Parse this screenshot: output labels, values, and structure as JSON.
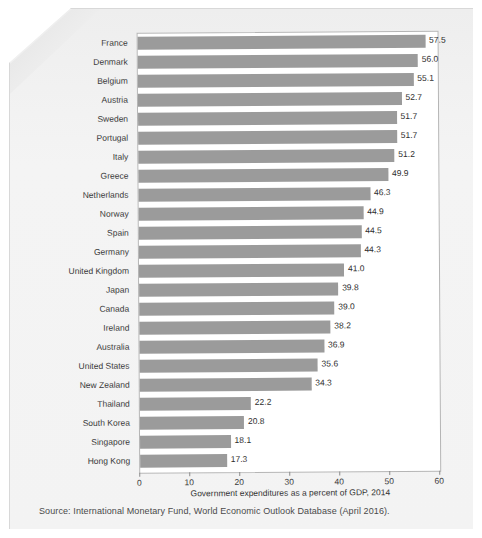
{
  "chart_data": {
    "type": "bar",
    "orientation": "horizontal",
    "title": "",
    "xlabel": "Government expenditures as a percent of GDP, 2014",
    "ylabel": "",
    "xlim": [
      0,
      60
    ],
    "xticks": [
      0,
      10,
      20,
      30,
      40,
      50,
      60
    ],
    "grid": false,
    "legend": false,
    "bar_color": "#9b9b9b",
    "categories": [
      "France",
      "Denmark",
      "Belgium",
      "Austria",
      "Sweden",
      "Portugal",
      "Italy",
      "Greece",
      "Netherlands",
      "Norway",
      "Spain",
      "Germany",
      "United Kingdom",
      "Japan",
      "Canada",
      "Ireland",
      "Australia",
      "United States",
      "New Zealand",
      "Thailand",
      "South Korea",
      "Singapore",
      "Hong Kong"
    ],
    "values": [
      57.5,
      56.0,
      55.1,
      52.7,
      51.7,
      51.7,
      51.2,
      49.9,
      46.3,
      44.9,
      44.5,
      44.3,
      41.0,
      39.8,
      39.0,
      38.2,
      36.9,
      35.6,
      34.3,
      22.2,
      20.8,
      18.1,
      17.3
    ],
    "value_labels": [
      "57.5",
      "56.0",
      "55.1",
      "52.7",
      "51.7",
      "51.7",
      "51.2",
      "49.9",
      "46.3",
      "44.9",
      "44.5",
      "44.3",
      "41.0",
      "39.8",
      "39.0",
      "38.2",
      "36.9",
      "35.6",
      "34.3",
      "22.2",
      "20.8",
      "18.1",
      "17.3"
    ],
    "xtick_labels": [
      "0",
      "10",
      "20",
      "30",
      "40",
      "50",
      "60"
    ]
  },
  "source": {
    "text": "Source: International Monetary Fund, World Economic Outlook Database (April 2016)."
  }
}
